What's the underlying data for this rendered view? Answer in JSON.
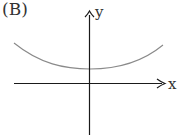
{
  "panel_label": "(B)",
  "axes": {
    "x_label": "x",
    "y_label": "y"
  },
  "curve": {
    "description": "U-shaped curve entirely above the x-axis, minimum on the y-axis",
    "color": "#8a8a8a",
    "points": [
      [
        14,
        43
      ],
      [
        50,
        62
      ],
      [
        90,
        69
      ],
      [
        128,
        63
      ],
      [
        163,
        45
      ]
    ]
  },
  "colors": {
    "axis": "#1a1a1a",
    "curve": "#8a8a8a",
    "background": "#ffffff"
  }
}
